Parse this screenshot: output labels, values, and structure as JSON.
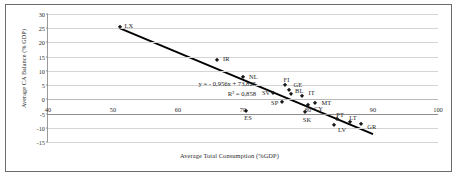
{
  "chart_data": {
    "type": "scatter",
    "title": "",
    "xlabel": "Average Total Consumption (%GDP)",
    "ylabel": "Average CA Balance (% GDP)",
    "xlim": [
      40,
      100
    ],
    "ylim": [
      -15,
      30
    ],
    "xticks": [
      40,
      50,
      60,
      70,
      80,
      90,
      100
    ],
    "yticks": [
      30,
      25,
      20,
      15,
      10,
      5,
      0,
      -5,
      -10,
      -15
    ],
    "grid": "horizontal",
    "legend": "none",
    "point_color": "#1a1a1a",
    "trendline_color": "#000000",
    "points": [
      {
        "label": "LX",
        "x": 51.0,
        "y": 25.5
      },
      {
        "label": "IR",
        "x": 66.0,
        "y": 14.0
      },
      {
        "label": "NL",
        "x": 70.0,
        "y": 7.8
      },
      {
        "label": "FI",
        "x": 76.4,
        "y": 5.0
      },
      {
        "label": "GE",
        "x": 77.0,
        "y": 3.4
      },
      {
        "label": "SV",
        "x": 74.6,
        "y": 2.2
      },
      {
        "label": "BL",
        "x": 77.4,
        "y": 1.8
      },
      {
        "label": "IT",
        "x": 79.0,
        "y": 1.3
      },
      {
        "label": "SP",
        "x": 76.0,
        "y": -0.8
      },
      {
        "label": "MT",
        "x": 81.0,
        "y": -1.4
      },
      {
        "label": "CY",
        "x": 80.0,
        "y": -2.0
      },
      {
        "label": "ES",
        "x": 70.5,
        "y": -4.2
      },
      {
        "label": "SK",
        "x": 79.5,
        "y": -4.5
      },
      {
        "label": "PT",
        "x": 84.5,
        "y": -7.0
      },
      {
        "label": "LV",
        "x": 84.0,
        "y": -9.0
      },
      {
        "label": "LT",
        "x": 86.5,
        "y": -7.8
      },
      {
        "label": "GR",
        "x": 88.2,
        "y": -8.8
      }
    ],
    "label_offsets": {
      "LX": {
        "dx": 5,
        "dy": -1
      },
      "IR": {
        "dx": 6,
        "dy": -1
      },
      "NL": {
        "dx": 6,
        "dy": -1
      },
      "FI": {
        "dx": -1,
        "dy": -6
      },
      "GE": {
        "dx": 5,
        "dy": -5
      },
      "SV": {
        "dx": -11,
        "dy": -1
      },
      "BL": {
        "dx": 4,
        "dy": -4
      },
      "IT": {
        "dx": 7,
        "dy": -3
      },
      "SP": {
        "dx": -11,
        "dy": 1
      },
      "MT": {
        "dx": 7,
        "dy": -1
      },
      "CY": {
        "dx": 6,
        "dy": 3
      },
      "ES": {
        "dx": -2,
        "dy": 6
      },
      "SK": {
        "dx": -2,
        "dy": 7
      },
      "PT": {
        "dx": -1,
        "dy": -5
      },
      "LV": {
        "dx": 4,
        "dy": 5
      },
      "LT": {
        "dx": -1,
        "dy": -4
      },
      "GR": {
        "dx": 6,
        "dy": 2
      }
    },
    "trendline": {
      "slope": -0.956,
      "intercept": 73.825,
      "x_start": 51.0,
      "x_end": 90.0
    },
    "annotations": {
      "equation": "y = - 0,956x + 73,825",
      "r_squared": "R² = 0,858"
    }
  }
}
